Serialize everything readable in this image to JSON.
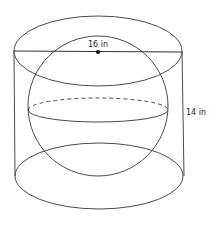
{
  "diagram": {
    "type": "sphere-inscribed-in-cylinder",
    "labels": {
      "diameter": "16 in",
      "height": "14 in"
    },
    "colors": {
      "stroke": "#4a4a4a",
      "point": "#111111",
      "background": "#ffffff"
    }
  }
}
